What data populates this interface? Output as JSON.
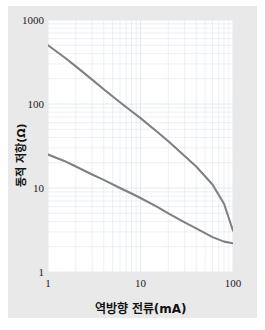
{
  "figure": {
    "background_color": "#e9e9e9",
    "plot_background_color": "#ffffff",
    "curve_color": "#808080",
    "grid_color": "#dfe6ef",
    "text_color": "#111111"
  },
  "axes": {
    "x_label": "역방향 전류(mA)",
    "y_label": "동적 저항(Ω)",
    "x_ticks": [
      "1",
      "10",
      "100"
    ],
    "y_ticks": [
      "1",
      "10",
      "100",
      "1000"
    ]
  },
  "chart_data": {
    "type": "line",
    "title": "",
    "xlabel": "역방향 전류(mA)",
    "ylabel": "동적 저항(Ω)",
    "xscale": "log",
    "yscale": "log",
    "xlim": [
      1,
      100
    ],
    "ylim": [
      1,
      1000
    ],
    "xticks": [
      1,
      10,
      100
    ],
    "yticks": [
      1,
      10,
      100,
      1000
    ],
    "grid": true,
    "grid_which": "both",
    "legend": "none",
    "series": [
      {
        "name": "upper-curve",
        "x": [
          1,
          1.5,
          2,
          3,
          4,
          6,
          8,
          10,
          15,
          20,
          30,
          40,
          60,
          80,
          100
        ],
        "y": [
          500,
          360,
          280,
          195,
          150,
          105,
          82,
          68,
          47,
          36,
          24,
          18,
          11,
          6.5,
          3.1
        ]
      },
      {
        "name": "lower-curve",
        "x": [
          1,
          1.5,
          2,
          3,
          4,
          6,
          8,
          10,
          15,
          20,
          30,
          40,
          60,
          80,
          100
        ],
        "y": [
          25,
          21,
          18,
          14.5,
          12.5,
          10,
          8.6,
          7.6,
          6.0,
          5.0,
          3.9,
          3.3,
          2.6,
          2.3,
          2.2
        ]
      }
    ]
  }
}
